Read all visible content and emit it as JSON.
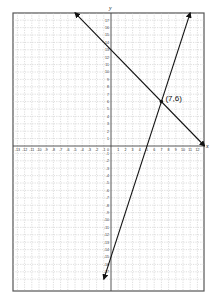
{
  "chart_data": {
    "type": "line",
    "title": "",
    "xlabel": "x",
    "ylabel": "y",
    "xlim": [
      -13.5,
      13
    ],
    "ylim": [
      -18.5,
      18
    ],
    "grid": true,
    "x_ticks": [
      -13,
      -12,
      -11,
      -10,
      -9,
      -8,
      -7,
      -6,
      -5,
      -4,
      -3,
      -2,
      -1,
      1,
      2,
      3,
      4,
      5,
      6,
      7,
      8,
      9,
      10,
      11,
      12
    ],
    "y_ticks": [
      17,
      16,
      15,
      14,
      13,
      12,
      11,
      10,
      9,
      8,
      7,
      6,
      5,
      4,
      3,
      2,
      1,
      -1,
      -2,
      -3,
      -4,
      -5,
      -6,
      -7,
      -8,
      -9,
      -10,
      -11,
      -12,
      -13,
      -14,
      -15,
      -16,
      -17
    ],
    "origin_label": "0",
    "series": [
      {
        "name": "line 1",
        "equation": "y = -x + 13",
        "slope": -1,
        "intercept": 13,
        "x": [
          -5,
          13
        ],
        "y": [
          18,
          0
        ],
        "arrows": "both"
      },
      {
        "name": "line 2",
        "equation": "y = 3x - 15",
        "slope": 3,
        "intercept": -15,
        "x": [
          -1,
          11
        ],
        "y": [
          -18,
          18
        ],
        "arrows": "both"
      }
    ],
    "annotations": [
      {
        "type": "point",
        "x": 7,
        "y": 6,
        "label": "(7,6)"
      }
    ]
  },
  "labels": {
    "x_axis": "x",
    "y_axis": "y",
    "intersection": "(7,6)",
    "origin": "0"
  }
}
